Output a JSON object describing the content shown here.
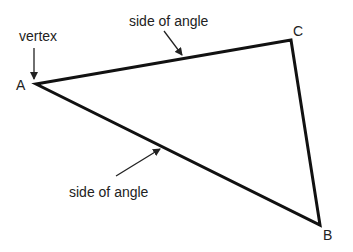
{
  "diagram": {
    "vertices": [
      {
        "name": "A",
        "x": 36,
        "y": 84,
        "label_x": 16,
        "label_y": 90
      },
      {
        "name": "B",
        "x": 320,
        "y": 225,
        "label_x": 323,
        "label_y": 240
      },
      {
        "name": "C",
        "x": 291,
        "y": 40,
        "label_x": 293,
        "label_y": 36
      }
    ],
    "annotations": {
      "vertex": "vertex",
      "side_top": "side of angle",
      "side_bottom": "side of angle"
    }
  }
}
